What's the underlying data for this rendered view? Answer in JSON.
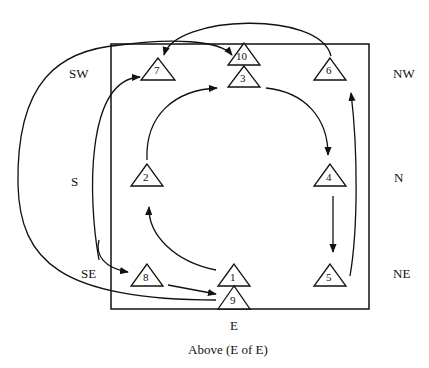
{
  "diagram": {
    "caption": "Above (E of E)",
    "box_side_label": "E",
    "direction_labels": {
      "sw": "SW",
      "s": "S",
      "se": "SE",
      "nw": "NW",
      "n": "N",
      "ne": "NE"
    },
    "nodes": [
      {
        "id": "1",
        "label": "1",
        "x": 234,
        "y": 276
      },
      {
        "id": "2",
        "label": "2",
        "x": 147,
        "y": 180
      },
      {
        "id": "3",
        "label": "3",
        "x": 244,
        "y": 67
      },
      {
        "id": "4",
        "label": "4",
        "x": 330,
        "y": 180
      },
      {
        "id": "5",
        "label": "5",
        "x": 330,
        "y": 276
      },
      {
        "id": "6",
        "label": "6",
        "x": 330,
        "y": 67
      },
      {
        "id": "7",
        "label": "7",
        "x": 158,
        "y": 67
      },
      {
        "id": "8",
        "label": "8",
        "x": 147,
        "y": 276
      },
      {
        "id": "9",
        "label": "9",
        "x": 234,
        "y": 298
      },
      {
        "id": "10",
        "label": "10",
        "x": 244,
        "y": 45
      }
    ],
    "edges": [
      {
        "from": "1",
        "to": "2"
      },
      {
        "from": "2",
        "to": "3"
      },
      {
        "from": "3",
        "to": "4"
      },
      {
        "from": "4",
        "to": "5"
      },
      {
        "from": "5",
        "to": "6"
      },
      {
        "from": "6",
        "to": "7"
      },
      {
        "from": "7",
        "to": "8"
      },
      {
        "from": "8",
        "to": "9"
      },
      {
        "from": "9",
        "to": "10"
      },
      {
        "from": "8",
        "to": "7"
      }
    ]
  }
}
